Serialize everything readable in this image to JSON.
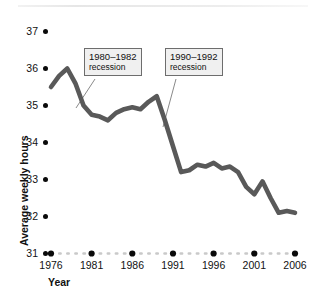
{
  "chart_data": {
    "type": "line",
    "title": "",
    "xlabel": "Year",
    "ylabel": "Average weekly hours",
    "xlim": [
      1976,
      2006
    ],
    "ylim": [
      31,
      37
    ],
    "grid": false,
    "legend": "none",
    "y_ticks": [
      37,
      36,
      35,
      34,
      33,
      32,
      31
    ],
    "x_ticks": [
      1976,
      1981,
      1986,
      1991,
      1996,
      2001,
      2006
    ],
    "series": [
      {
        "name": "Average weekly hours",
        "color": "#595959",
        "x": [
          1976,
          1977,
          1978,
          1979,
          1980,
          1981,
          1982,
          1983,
          1984,
          1985,
          1986,
          1987,
          1988,
          1989,
          1990,
          1991,
          1992,
          1993,
          1994,
          1995,
          1996,
          1997,
          1998,
          1999,
          2000,
          2001,
          2002,
          2003,
          2004,
          2005,
          2006
        ],
        "values": [
          35.5,
          35.8,
          36.0,
          35.6,
          35.0,
          34.75,
          34.7,
          34.6,
          34.8,
          34.9,
          34.95,
          34.9,
          35.1,
          35.25,
          34.6,
          33.9,
          33.2,
          33.25,
          33.4,
          33.35,
          33.45,
          33.3,
          33.35,
          33.2,
          32.8,
          32.6,
          32.95,
          32.5,
          32.1,
          32.15,
          32.1
        ]
      }
    ],
    "annotations": [
      {
        "id": "recession-1980",
        "line1": "1980–1982",
        "line2": "recession"
      },
      {
        "id": "recession-1990",
        "line1": "1990–1992",
        "line2": "recession"
      }
    ]
  },
  "axis": {
    "y_title": "Average weekly hours",
    "x_title": "Year"
  },
  "colors": {
    "line": "#595959",
    "dot": "#0a0a0a",
    "anno_fill": "#f0f0f0",
    "anno_border": "#6d6d6d",
    "leader": "#8a8a8a",
    "minor_dot": "#c9c9c9"
  }
}
